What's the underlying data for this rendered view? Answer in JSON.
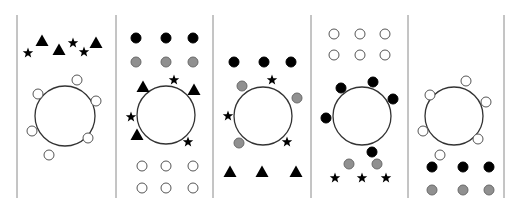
{
  "canvas": {
    "width": 518,
    "height": 211,
    "background": "#ffffff"
  },
  "colors": {
    "divider": "#8a8a8a",
    "outline": "#333333",
    "black": "#000000",
    "gray": "#909090",
    "white": "#ffffff"
  },
  "dividers": [
    17,
    116,
    213,
    311,
    408,
    504
  ],
  "divider_y": [
    15,
    198
  ],
  "panels": [
    {
      "id": "panel-1",
      "cell": {
        "cx": 65,
        "cy": 116,
        "r": 30
      },
      "particles": [
        {
          "shape": "star",
          "fill": "black",
          "x": 28,
          "y": 53
        },
        {
          "shape": "triangle",
          "fill": "black",
          "x": 42,
          "y": 41
        },
        {
          "shape": "triangle",
          "fill": "black",
          "x": 59,
          "y": 50
        },
        {
          "shape": "star",
          "fill": "black",
          "x": 73,
          "y": 43
        },
        {
          "shape": "star",
          "fill": "black",
          "x": 84,
          "y": 52
        },
        {
          "shape": "triangle",
          "fill": "black",
          "x": 96,
          "y": 43
        },
        {
          "shape": "circle",
          "fill": "white",
          "x": 77,
          "y": 80
        },
        {
          "shape": "circle",
          "fill": "white",
          "x": 38,
          "y": 94
        },
        {
          "shape": "circle",
          "fill": "white",
          "x": 96,
          "y": 101
        },
        {
          "shape": "circle",
          "fill": "white",
          "x": 32,
          "y": 131
        },
        {
          "shape": "circle",
          "fill": "white",
          "x": 88,
          "y": 138
        },
        {
          "shape": "circle",
          "fill": "white",
          "x": 49,
          "y": 155
        }
      ]
    },
    {
      "id": "panel-2",
      "cell": {
        "cx": 166,
        "cy": 115,
        "r": 29
      },
      "particles": [
        {
          "shape": "circle",
          "fill": "black",
          "x": 136,
          "y": 38
        },
        {
          "shape": "circle",
          "fill": "black",
          "x": 166,
          "y": 38
        },
        {
          "shape": "circle",
          "fill": "black",
          "x": 193,
          "y": 38
        },
        {
          "shape": "circle",
          "fill": "gray",
          "x": 136,
          "y": 62
        },
        {
          "shape": "circle",
          "fill": "gray",
          "x": 166,
          "y": 62
        },
        {
          "shape": "circle",
          "fill": "gray",
          "x": 193,
          "y": 62
        },
        {
          "shape": "triangle",
          "fill": "black",
          "x": 143,
          "y": 87
        },
        {
          "shape": "star",
          "fill": "black",
          "x": 174,
          "y": 80
        },
        {
          "shape": "triangle",
          "fill": "black",
          "x": 194,
          "y": 90
        },
        {
          "shape": "star",
          "fill": "black",
          "x": 131,
          "y": 117
        },
        {
          "shape": "triangle",
          "fill": "black",
          "x": 137,
          "y": 135
        },
        {
          "shape": "star",
          "fill": "black",
          "x": 188,
          "y": 142
        },
        {
          "shape": "circle",
          "fill": "white",
          "x": 142,
          "y": 166
        },
        {
          "shape": "circle",
          "fill": "white",
          "x": 166,
          "y": 166
        },
        {
          "shape": "circle",
          "fill": "white",
          "x": 193,
          "y": 166
        },
        {
          "shape": "circle",
          "fill": "white",
          "x": 142,
          "y": 188
        },
        {
          "shape": "circle",
          "fill": "white",
          "x": 166,
          "y": 188
        },
        {
          "shape": "circle",
          "fill": "white",
          "x": 193,
          "y": 188
        }
      ]
    },
    {
      "id": "panel-3",
      "cell": {
        "cx": 263,
        "cy": 116,
        "r": 29
      },
      "particles": [
        {
          "shape": "circle",
          "fill": "black",
          "x": 234,
          "y": 62
        },
        {
          "shape": "circle",
          "fill": "black",
          "x": 264,
          "y": 62
        },
        {
          "shape": "circle",
          "fill": "black",
          "x": 291,
          "y": 62
        },
        {
          "shape": "circle",
          "fill": "gray",
          "x": 242,
          "y": 86
        },
        {
          "shape": "star",
          "fill": "black",
          "x": 272,
          "y": 80
        },
        {
          "shape": "circle",
          "fill": "gray",
          "x": 297,
          "y": 98
        },
        {
          "shape": "star",
          "fill": "black",
          "x": 228,
          "y": 116
        },
        {
          "shape": "circle",
          "fill": "gray",
          "x": 239,
          "y": 143
        },
        {
          "shape": "star",
          "fill": "black",
          "x": 287,
          "y": 142
        },
        {
          "shape": "triangle",
          "fill": "black",
          "x": 230,
          "y": 172
        },
        {
          "shape": "triangle",
          "fill": "black",
          "x": 262,
          "y": 172
        },
        {
          "shape": "triangle",
          "fill": "black",
          "x": 296,
          "y": 172
        }
      ]
    },
    {
      "id": "panel-4",
      "cell": {
        "cx": 362,
        "cy": 116,
        "r": 29
      },
      "particles": [
        {
          "shape": "circle",
          "fill": "white",
          "x": 334,
          "y": 34
        },
        {
          "shape": "circle",
          "fill": "white",
          "x": 360,
          "y": 34
        },
        {
          "shape": "circle",
          "fill": "white",
          "x": 385,
          "y": 34
        },
        {
          "shape": "circle",
          "fill": "white",
          "x": 334,
          "y": 55
        },
        {
          "shape": "circle",
          "fill": "white",
          "x": 360,
          "y": 55
        },
        {
          "shape": "circle",
          "fill": "white",
          "x": 385,
          "y": 55
        },
        {
          "shape": "circle",
          "fill": "black",
          "x": 341,
          "y": 88
        },
        {
          "shape": "circle",
          "fill": "black",
          "x": 373,
          "y": 82
        },
        {
          "shape": "circle",
          "fill": "black",
          "x": 393,
          "y": 99
        },
        {
          "shape": "circle",
          "fill": "black",
          "x": 326,
          "y": 118
        },
        {
          "shape": "circle",
          "fill": "black",
          "x": 372,
          "y": 152
        },
        {
          "shape": "circle",
          "fill": "gray",
          "x": 349,
          "y": 164
        },
        {
          "shape": "circle",
          "fill": "gray",
          "x": 377,
          "y": 164
        },
        {
          "shape": "star",
          "fill": "black",
          "x": 335,
          "y": 178
        },
        {
          "shape": "star",
          "fill": "black",
          "x": 362,
          "y": 178
        },
        {
          "shape": "star",
          "fill": "black",
          "x": 386,
          "y": 178
        }
      ]
    },
    {
      "id": "panel-5",
      "cell": {
        "cx": 454,
        "cy": 116,
        "r": 29
      },
      "particles": [
        {
          "shape": "circle",
          "fill": "white",
          "x": 466,
          "y": 81
        },
        {
          "shape": "circle",
          "fill": "white",
          "x": 430,
          "y": 95
        },
        {
          "shape": "circle",
          "fill": "white",
          "x": 486,
          "y": 102
        },
        {
          "shape": "circle",
          "fill": "white",
          "x": 423,
          "y": 131
        },
        {
          "shape": "circle",
          "fill": "white",
          "x": 478,
          "y": 139
        },
        {
          "shape": "circle",
          "fill": "white",
          "x": 440,
          "y": 155
        },
        {
          "shape": "circle",
          "fill": "black",
          "x": 432,
          "y": 167
        },
        {
          "shape": "circle",
          "fill": "black",
          "x": 463,
          "y": 167
        },
        {
          "shape": "circle",
          "fill": "black",
          "x": 489,
          "y": 167
        },
        {
          "shape": "circle",
          "fill": "gray",
          "x": 432,
          "y": 190
        },
        {
          "shape": "circle",
          "fill": "gray",
          "x": 463,
          "y": 190
        },
        {
          "shape": "circle",
          "fill": "gray",
          "x": 489,
          "y": 190
        }
      ]
    }
  ]
}
